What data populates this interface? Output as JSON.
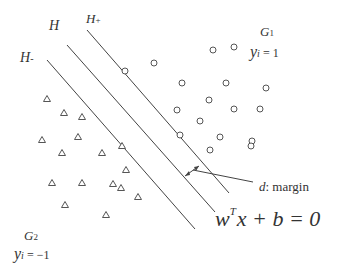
{
  "diagram": {
    "type": "svm-hyperplane",
    "colors": {
      "line": "#444444",
      "text": "#333333",
      "marker": "#555555"
    },
    "labels": {
      "h_plus": "H",
      "h_plus_sub": "+",
      "h": "H",
      "h_minus": "H",
      "h_minus_sub": "-",
      "g1": "G",
      "g1_sub": "1",
      "g1_y": "y",
      "g1_y_sub": "i",
      "g1_eq": " = 1",
      "g2": "G",
      "g2_sub": "2",
      "g2_y": "y",
      "g2_y_sub": "i",
      "g2_eq": " = −1",
      "margin_d": "d",
      "margin_text": ": margin",
      "eq_w": "w",
      "eq_T": "T",
      "eq_rest": "x + b = 0"
    },
    "lines": [
      {
        "name": "h-plus-line",
        "x1": 87,
        "y1": 30,
        "x2": 229,
        "y2": 193
      },
      {
        "name": "h-line",
        "x1": 67,
        "y1": 45,
        "x2": 215,
        "y2": 212
      },
      {
        "name": "h-minus-line",
        "x1": 47,
        "y1": 60,
        "x2": 195,
        "y2": 229
      }
    ],
    "circles": [
      [
        125,
        71
      ],
      [
        154,
        63
      ],
      [
        213,
        50
      ],
      [
        234,
        47
      ],
      [
        182,
        83
      ],
      [
        226,
        83
      ],
      [
        266,
        88
      ],
      [
        209,
        100
      ],
      [
        177,
        110
      ],
      [
        234,
        109
      ],
      [
        260,
        109
      ],
      [
        200,
        121
      ],
      [
        180,
        135
      ],
      [
        220,
        137
      ],
      [
        252,
        141
      ],
      [
        210,
        150
      ],
      [
        251,
        146
      ]
    ],
    "triangles": [
      [
        47,
        99
      ],
      [
        64,
        113
      ],
      [
        82,
        117
      ],
      [
        42,
        140
      ],
      [
        78,
        137
      ],
      [
        62,
        153
      ],
      [
        102,
        153
      ],
      [
        122,
        146
      ],
      [
        52,
        183
      ],
      [
        82,
        183
      ],
      [
        113,
        184
      ],
      [
        126,
        170
      ],
      [
        138,
        197
      ],
      [
        65,
        205
      ],
      [
        106,
        215
      ],
      [
        121,
        188
      ]
    ]
  }
}
